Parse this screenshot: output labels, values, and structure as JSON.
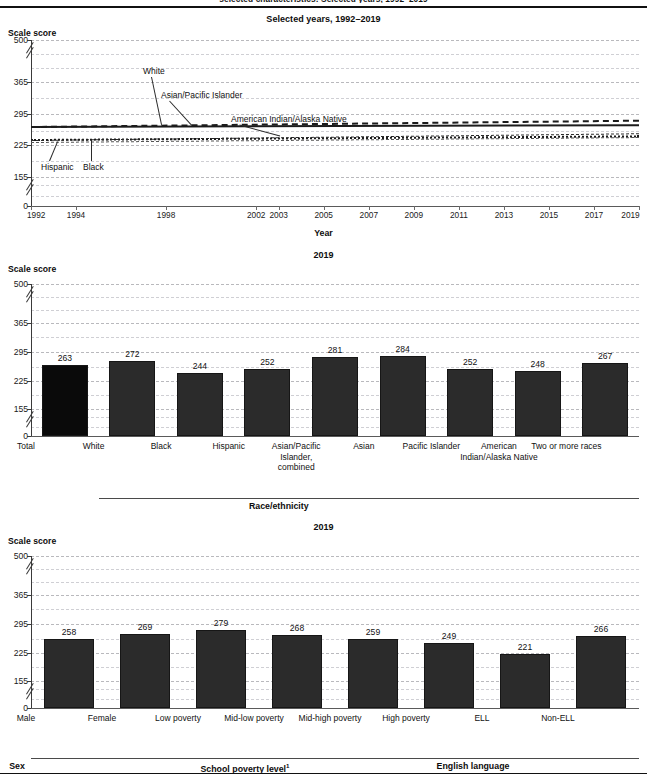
{
  "running_head": "selected characteristics: Selected years, 1992–2019",
  "chart_data": [
    {
      "type": "line",
      "title": "Selected years, 1992–2019",
      "ylabel": "Scale score",
      "xlabel": "Year",
      "ylim": [
        0,
        500
      ],
      "yticks": [
        "0",
        "155",
        "225",
        "295",
        "365",
        "500"
      ],
      "ytick_values": [
        0,
        155,
        225,
        295,
        365,
        500
      ],
      "grid": true,
      "axis_break": true,
      "x": [
        1992,
        1994,
        1998,
        2002,
        2003,
        2005,
        2007,
        2009,
        2011,
        2013,
        2015,
        2017,
        2019
      ],
      "xtick_labels": [
        "1992",
        "1994",
        "1998",
        "2002",
        "2003",
        "2005",
        "2007",
        "2009",
        "2011",
        "2013",
        "2015",
        "2017",
        "2019"
      ],
      "series": [
        {
          "name": "White",
          "style": "solid",
          "values": [
            268,
            268,
            270,
            271,
            271,
            272,
            272,
            273,
            273,
            273,
            272,
            272,
            272
          ]
        },
        {
          "name": "Asian/Pacific Islander",
          "style": "dashed",
          "values": [
            267,
            267,
            268,
            269,
            270,
            271,
            272,
            273,
            275,
            277,
            279,
            280,
            281
          ]
        },
        {
          "name": "American Indian/Alaska Native",
          "style": "dotted",
          "values": [
            240,
            240,
            243,
            244,
            245,
            246,
            247,
            248,
            248,
            248,
            248,
            248,
            248
          ]
        },
        {
          "name": "Hispanic",
          "style": "dash-dot",
          "values": [
            237,
            237,
            240,
            242,
            243,
            245,
            247,
            248,
            249,
            250,
            251,
            252,
            252
          ]
        },
        {
          "name": "Black",
          "style": "thin-dash",
          "values": [
            233,
            233,
            235,
            237,
            238,
            239,
            240,
            241,
            242,
            243,
            243,
            244,
            244
          ]
        }
      ],
      "callouts": [
        {
          "label": "White"
        },
        {
          "label": "Asian/Pacific Islander"
        },
        {
          "label": "American Indian/Alaska Native"
        },
        {
          "label": "Black"
        },
        {
          "label": "Hispanic"
        }
      ]
    },
    {
      "type": "bar",
      "title": "2019",
      "ylabel": "Scale score",
      "ylim": [
        0,
        500
      ],
      "yticks": [
        "0",
        "155",
        "225",
        "295",
        "365",
        "500"
      ],
      "ytick_values": [
        0,
        155,
        225,
        295,
        365,
        500
      ],
      "grid": true,
      "axis_break": true,
      "categories": [
        "Total",
        "White",
        "Black",
        "Hispanic",
        "Asian/Pacific Islander, combined",
        "Asian",
        "Pacific Islander",
        "American Indian/Alaska Native",
        "Two or more races"
      ],
      "values": [
        263,
        272,
        244,
        252,
        281,
        284,
        252,
        248,
        267
      ],
      "group_label": "Race/ethnicity",
      "group_rule_from": "White",
      "group_rule_to": "Two or more races"
    },
    {
      "type": "bar",
      "title": "2019",
      "ylabel": "Scale score",
      "ylim": [
        0,
        500
      ],
      "yticks": [
        "0",
        "155",
        "225",
        "295",
        "365",
        "500"
      ],
      "ytick_values": [
        0,
        155,
        225,
        295,
        365,
        500
      ],
      "grid": true,
      "axis_break": true,
      "categories": [
        "Male",
        "Female",
        "Low poverty",
        "Mid-low poverty",
        "Mid-high poverty",
        "High poverty",
        "ELL",
        "Non-ELL"
      ],
      "values": [
        258,
        269,
        279,
        268,
        259,
        249,
        221,
        266
      ],
      "groups": [
        {
          "label": "Sex",
          "footnote": ""
        },
        {
          "label": "School poverty level",
          "footnote": "1"
        },
        {
          "label": "English language learner (ELL) status",
          "footnote": ""
        }
      ]
    }
  ]
}
